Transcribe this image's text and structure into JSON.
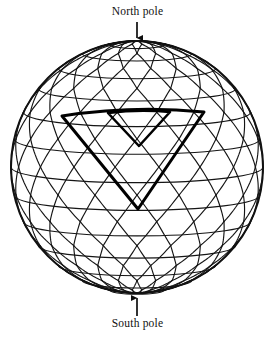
{
  "figure": {
    "background_color": "#ffffff",
    "ink_color": "#111111",
    "sphere": {
      "center_x": 137,
      "center_y": 167,
      "radius": 126,
      "outline_stroke_width": 2.0
    },
    "mesh": {
      "description": "Triangulated geodesic grid: horizontal latitude rings plus two families of slanted great-circle arcs forming triangles",
      "latitude_bands": 14,
      "meridian_sectors": 18,
      "line_stroke_width": 1.15,
      "line_color": "#151515"
    },
    "highlight": {
      "description": "Bold outlined spherical triangle (one face patch) on the front-upper hemisphere, containing a smaller bold inner triangle",
      "stroke_width": 3.0,
      "color": "#000000",
      "outer_triangle": [
        {
          "x": 62,
          "y": 116
        },
        {
          "x": 204,
          "y": 112
        },
        {
          "x": 138,
          "y": 209
        }
      ],
      "inner_triangle": [
        {
          "x": 108,
          "y": 113
        },
        {
          "x": 170,
          "y": 112
        },
        {
          "x": 139,
          "y": 146
        }
      ]
    },
    "annotations": [
      {
        "name": "north-pole",
        "label": "North pole",
        "arrow_direction": "down",
        "label_x": 137,
        "label_y": 14,
        "arrow_from": {
          "x": 137,
          "y": 22
        },
        "arrow_to": {
          "x": 137,
          "y": 41
        }
      },
      {
        "name": "south-pole",
        "label": "South pole",
        "arrow_direction": "up",
        "label_x": 137,
        "label_y": 326,
        "arrow_from": {
          "x": 137,
          "y": 316
        },
        "arrow_to": {
          "x": 137,
          "y": 295
        }
      }
    ]
  },
  "labels": {
    "north_pole": "North pole",
    "south_pole": "South pole"
  },
  "chart_data": {
    "type": "diagram",
    "annotations": [
      "North pole",
      "South pole"
    ],
    "elements": [
      "sphere-outline",
      "latitude-rings",
      "triangular-mesh",
      "highlighted-triangle",
      "north-pole-arrow",
      "south-pole-arrow"
    ]
  }
}
